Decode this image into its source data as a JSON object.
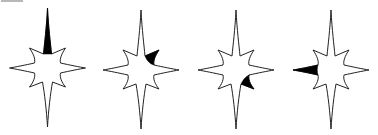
{
  "figure": {
    "type": "sequence-puzzle",
    "colors": {
      "outline": "#222222",
      "fill": "#ffffff",
      "shade": "#000000"
    },
    "stars": [
      {
        "index": 1,
        "center": [
          47.5,
          68
        ],
        "shaded_spike": "top"
      },
      {
        "index": 2,
        "center": [
          141,
          70
        ],
        "shaded_spike": "top-right"
      },
      {
        "index": 3,
        "center": [
          236,
          70
        ],
        "shaded_spike": "bottom-right"
      },
      {
        "index": 4,
        "center": [
          331,
          70
        ],
        "shaded_spike": "left"
      }
    ]
  }
}
